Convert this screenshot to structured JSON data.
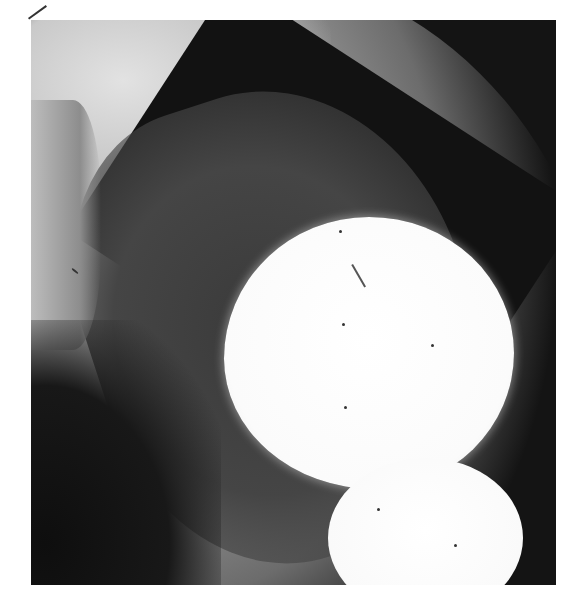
{
  "image": {
    "kind": "radiograph",
    "description": "Grayscale X-ray showing two bright round radiopaque masses (one large, one smaller below it) within a darker soft-tissue cavity bordered by a lighter band",
    "colors": {
      "background": "#ffffff",
      "film_dark": "#141414",
      "tissue_mid": "#6c6c6c",
      "tissue_light": "#d6d6d6",
      "opacity_white": "#ffffff"
    }
  }
}
